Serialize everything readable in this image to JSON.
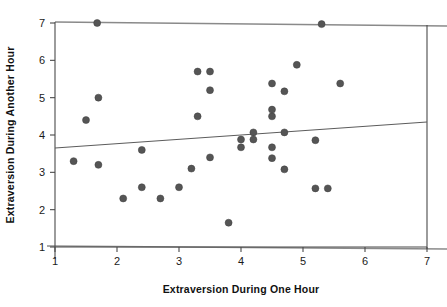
{
  "chart_data": {
    "type": "scatter",
    "title": "",
    "xlabel": "Extraversion During One Hour",
    "ylabel": "Extraversion During Another Hour",
    "xlim": [
      1,
      7
    ],
    "ylim": [
      1,
      7
    ],
    "xticks": [
      1,
      2,
      3,
      4,
      5,
      6,
      7
    ],
    "yticks": [
      1,
      2,
      3,
      4,
      5,
      6,
      7
    ],
    "xtick_labels": [
      "1",
      "2",
      "3",
      "4",
      "5",
      "6",
      "7"
    ],
    "ytick_labels": [
      "1",
      "2",
      "3",
      "4",
      "5",
      "6",
      "7"
    ],
    "grid": false,
    "legend": false,
    "marker": {
      "shape": "circle",
      "color": "#555555",
      "size_px": 7
    },
    "trendline": {
      "type": "linear-fit",
      "color": "#5c5c5c",
      "x_start": 1,
      "y_start": 3.65,
      "x_end": 7,
      "y_end": 4.35
    },
    "points": [
      {
        "x": 1.3,
        "y": 3.3
      },
      {
        "x": 1.5,
        "y": 4.4
      },
      {
        "x": 1.68,
        "y": 7.0
      },
      {
        "x": 1.7,
        "y": 5.0
      },
      {
        "x": 1.7,
        "y": 3.2
      },
      {
        "x": 2.1,
        "y": 2.3
      },
      {
        "x": 2.4,
        "y": 3.6
      },
      {
        "x": 2.4,
        "y": 2.6
      },
      {
        "x": 2.7,
        "y": 2.3
      },
      {
        "x": 3.0,
        "y": 2.6
      },
      {
        "x": 3.2,
        "y": 3.1
      },
      {
        "x": 3.3,
        "y": 5.7
      },
      {
        "x": 3.5,
        "y": 5.7
      },
      {
        "x": 3.5,
        "y": 5.2
      },
      {
        "x": 3.3,
        "y": 4.5
      },
      {
        "x": 3.5,
        "y": 3.4
      },
      {
        "x": 3.8,
        "y": 1.65
      },
      {
        "x": 4.0,
        "y": 3.88
      },
      {
        "x": 4.0,
        "y": 3.67
      },
      {
        "x": 4.2,
        "y": 4.07
      },
      {
        "x": 4.2,
        "y": 3.88
      },
      {
        "x": 4.5,
        "y": 5.38
      },
      {
        "x": 4.5,
        "y": 4.68
      },
      {
        "x": 4.5,
        "y": 4.5
      },
      {
        "x": 4.5,
        "y": 3.67
      },
      {
        "x": 4.5,
        "y": 3.38
      },
      {
        "x": 4.7,
        "y": 5.17
      },
      {
        "x": 4.7,
        "y": 4.07
      },
      {
        "x": 4.7,
        "y": 3.08
      },
      {
        "x": 4.9,
        "y": 5.88
      },
      {
        "x": 5.2,
        "y": 3.86
      },
      {
        "x": 5.2,
        "y": 2.57
      },
      {
        "x": 5.3,
        "y": 6.97
      },
      {
        "x": 5.4,
        "y": 2.57
      },
      {
        "x": 5.6,
        "y": 5.38
      }
    ]
  }
}
